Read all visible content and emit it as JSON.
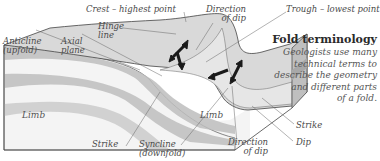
{
  "diagram": {
    "type": "geologic-fold-block-diagram",
    "colors": {
      "top_surface": "#d9d9d9",
      "band_dark": "#bdbdbd",
      "band_light": "#f4f4f4",
      "outline": "#444444",
      "arrow": "#1a1a1a",
      "label_text": "#4a4a4a",
      "leader_line": "#666666"
    },
    "labels": {
      "crest": "Crest – highest point",
      "hinge_line_1": "Hinge",
      "hinge_line_2": "line",
      "anticline_1": "Anticline",
      "anticline_2": "(upfold)",
      "axial_plane_1": "Axial",
      "axial_plane_2": "plane",
      "direction_dip_top_1": "Direction",
      "direction_dip_top_2": "of dip",
      "trough": "Trough – lowest point",
      "limb_left": "Limb",
      "limb_right": "Limb",
      "strike_left": "Strike",
      "syncline_1": "Syncline",
      "syncline_2": "(downfold)",
      "direction_dip_bottom_1": "Direction",
      "direction_dip_bottom_2": "of dip",
      "strike_right": "Strike",
      "dip": "Dip"
    }
  },
  "sidebar": {
    "title": "Fold terminology",
    "body_lines": [
      "Geologists use many",
      "technical terms to",
      "describe the geometry",
      "and different parts",
      "of a fold."
    ]
  }
}
